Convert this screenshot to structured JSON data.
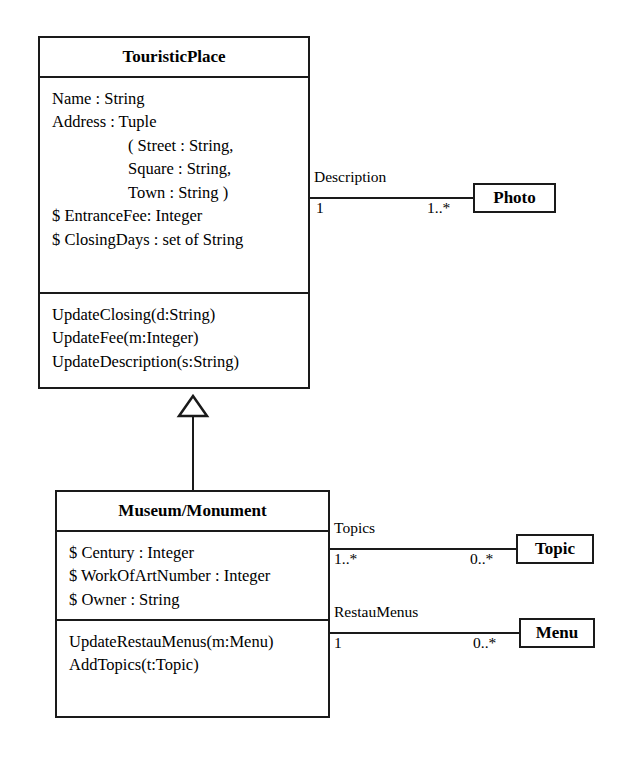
{
  "diagram": {
    "classes": [
      {
        "id": "touristic-place",
        "name": "TouristicPlace",
        "attributes": [
          {
            "text": "Name : String",
            "indent": 0
          },
          {
            "text": "Address : Tuple",
            "indent": 0
          },
          {
            "text": "( Street : String,",
            "indent": 1
          },
          {
            "text": "Square : String,",
            "indent": 1
          },
          {
            "text": "Town : String )",
            "indent": 1
          },
          {
            "text": "$ EntranceFee: Integer",
            "indent": 0
          },
          {
            "text": "$ ClosingDays : set of String",
            "indent": 0
          }
        ],
        "operations": [
          {
            "text": "UpdateClosing(d:String)",
            "indent": 0
          },
          {
            "text": "UpdateFee(m:Integer)",
            "indent": 0
          },
          {
            "text": "UpdateDescription(s:String)",
            "indent": 0
          }
        ]
      },
      {
        "id": "museum-monument",
        "name": "Museum/Monument",
        "attributes": [
          {
            "text": "$ Century : Integer",
            "indent": 0
          },
          {
            "text": "$ WorkOfArtNumber : Integer",
            "indent": 0
          },
          {
            "text": "$ Owner : String",
            "indent": 0
          }
        ],
        "operations": [
          {
            "text": "UpdateRestauMenus(m:Menu)",
            "indent": 0
          },
          {
            "text": "AddTopics(t:Topic)",
            "indent": 0
          }
        ]
      },
      {
        "id": "photo",
        "name": "Photo"
      },
      {
        "id": "topic",
        "name": "Topic"
      },
      {
        "id": "menu",
        "name": "Menu"
      }
    ],
    "associations": [
      {
        "id": "description",
        "label": "Description",
        "source": "TouristicPlace",
        "target": "Photo",
        "source_multiplicity": "1",
        "target_multiplicity": "1..*"
      },
      {
        "id": "topics",
        "label": "Topics",
        "source": "Museum/Monument",
        "target": "Topic",
        "source_multiplicity": "1..*",
        "target_multiplicity": "0..*"
      },
      {
        "id": "restau-menus",
        "label": "RestauMenus",
        "source": "Museum/Monument",
        "target": "Menu",
        "source_multiplicity": "1",
        "target_multiplicity": "0..*"
      }
    ],
    "generalizations": [
      {
        "id": "museum-inherits-touristicplace",
        "child": "Museum/Monument",
        "parent": "TouristicPlace"
      }
    ],
    "colors": {
      "stroke": "#1a1a1a",
      "fill": "#ffffff",
      "text": "#000000"
    }
  }
}
